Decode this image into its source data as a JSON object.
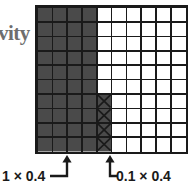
{
  "figure": {
    "axis_label_partial": "vity",
    "type": "grid-subdivision-diagram",
    "grid": {
      "columns": 10,
      "rows": 10,
      "fill_color": "#4a4a4a",
      "empty_color": "#ffffff",
      "line_color": "#1a1a1a",
      "border_color": "#1a1a1a",
      "shaded_columns": 4,
      "hatched": {
        "column_index": 4,
        "row_start_index": 6,
        "count": 4,
        "mark": "x-cross"
      }
    },
    "annotations": [
      {
        "name": "left-dimension",
        "label": "1 × 0.4",
        "arrow_target_column": 2,
        "arrow_x": 67,
        "arrow_tip_y": 155,
        "arrow_tail_y": 172
      },
      {
        "name": "right-dimension",
        "label": "0.1 × 0.4",
        "arrow_target_column": 5,
        "arrow_x": 110,
        "arrow_tip_y": 155,
        "arrow_tail_y": 172
      }
    ]
  },
  "chart_data": {
    "type": "heatmap",
    "title": "",
    "xlabel": "",
    "ylabel": "vity",
    "categories": [
      "c1",
      "c2",
      "c3",
      "c4",
      "c5",
      "c6",
      "c7",
      "c8",
      "c9",
      "c10"
    ],
    "rows": 10,
    "cols": 10,
    "values": [
      [
        1,
        1,
        1,
        1,
        0,
        0,
        0,
        0,
        0,
        0
      ],
      [
        1,
        1,
        1,
        1,
        0,
        0,
        0,
        0,
        0,
        0
      ],
      [
        1,
        1,
        1,
        1,
        0,
        0,
        0,
        0,
        0,
        0
      ],
      [
        1,
        1,
        1,
        1,
        0,
        0,
        0,
        0,
        0,
        0
      ],
      [
        1,
        1,
        1,
        1,
        0,
        0,
        0,
        0,
        0,
        0
      ],
      [
        1,
        1,
        1,
        1,
        0,
        0,
        0,
        0,
        0,
        0
      ],
      [
        1,
        1,
        1,
        1,
        2,
        0,
        0,
        0,
        0,
        0
      ],
      [
        1,
        1,
        1,
        1,
        2,
        0,
        0,
        0,
        0,
        0
      ],
      [
        1,
        1,
        1,
        1,
        2,
        0,
        0,
        0,
        0,
        0
      ],
      [
        1,
        1,
        1,
        1,
        2,
        0,
        0,
        0,
        0,
        0
      ]
    ],
    "value_legend": {
      "0": "empty",
      "1": "shaded",
      "2": "shaded-with-x"
    },
    "annotations": [
      "1 × 0.4",
      "0.1 × 0.4"
    ],
    "grid": true,
    "legend_position": "none"
  }
}
